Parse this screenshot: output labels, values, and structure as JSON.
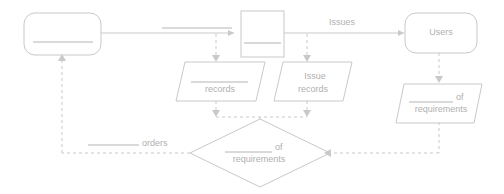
{
  "diagram": {
    "colors": {
      "stroke": "#c9c9c9",
      "text": "#b0b0b0",
      "rule": "#b4b4b4",
      "background": "#ffffff"
    },
    "nodes": {
      "external_entity_left": {
        "shape": "rounded-rectangle",
        "label": "",
        "has_blank_line": true
      },
      "process_box": {
        "shape": "rectangle",
        "label": "",
        "has_blank_line": true
      },
      "external_entity_users": {
        "shape": "rounded-rectangle",
        "label": "Users",
        "has_blank_line": false
      },
      "datastore_records": {
        "shape": "parallelogram",
        "label": "records",
        "has_blank_line": true
      },
      "datastore_issue_records": {
        "shape": "parallelogram",
        "label_line1": "Issue",
        "label_line2": "records",
        "has_blank_line": false
      },
      "datastore_requirements": {
        "shape": "parallelogram",
        "label_line1": "of",
        "label_line2": "requirements",
        "has_blank_line": true
      },
      "decision_requirements": {
        "shape": "diamond",
        "label_line1": "of",
        "label_line2": "requirements",
        "has_blank_line": true
      }
    },
    "edges": {
      "entity_to_process": {
        "label": "",
        "style": "solid",
        "has_blank_line": true
      },
      "process_to_users": {
        "label": "Issues",
        "style": "solid",
        "has_blank_line": false
      },
      "process_to_records": {
        "label": "",
        "style": "dashed"
      },
      "process_to_issue_records": {
        "label": "",
        "style": "dashed"
      },
      "users_to_requirements": {
        "label": "",
        "style": "dashed"
      },
      "records_to_decision": {
        "label": "",
        "style": "dashed"
      },
      "issue_records_to_decision": {
        "label": "",
        "style": "dashed"
      },
      "requirements_to_decision": {
        "label": "",
        "style": "dashed"
      },
      "decision_to_entity": {
        "label": "orders",
        "style": "dashed",
        "has_blank_line": true
      }
    }
  }
}
